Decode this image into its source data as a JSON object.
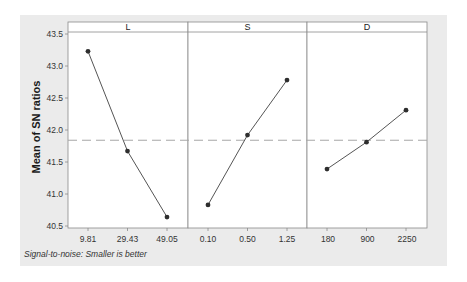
{
  "chart_data": {
    "type": "line",
    "title": "",
    "xlabel": "",
    "ylabel": "Mean of SN ratios",
    "footnote": "Signal-to-noise: Smaller is better",
    "ylim": [
      40.5,
      43.5
    ],
    "yticks": [
      "40.5",
      "41.0",
      "41.5",
      "42.0",
      "42.5",
      "43.0",
      "43.5"
    ],
    "grid": false,
    "legend": "none",
    "mean_reference_line": 41.84,
    "panels": [
      {
        "factor": "L",
        "levels": [
          "9.81",
          "29.43",
          "49.05"
        ],
        "values": [
          43.23,
          41.67,
          40.64
        ]
      },
      {
        "factor": "S",
        "levels": [
          "0.10",
          "0.50",
          "1.25"
        ],
        "values": [
          40.83,
          41.92,
          42.78
        ]
      },
      {
        "factor": "D",
        "levels": [
          "180",
          "900",
          "2250"
        ],
        "values": [
          41.39,
          41.81,
          42.31
        ]
      }
    ]
  },
  "colors": {
    "background": "#ebebeb",
    "plot_area": "#ffffff",
    "frame": "#8a8a8a",
    "line": "#555555",
    "marker": "#2e2e2e",
    "reference_line": "#a6a6a6"
  }
}
